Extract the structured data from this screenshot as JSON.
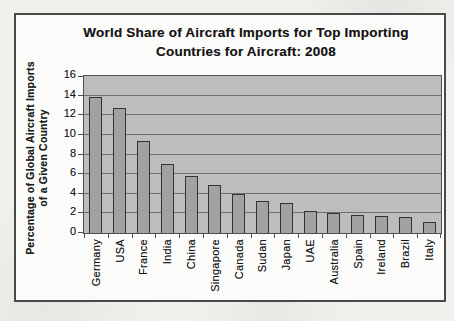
{
  "figure": {
    "title_line1": "World Share of Aircraft Imports for Top Importing",
    "title_line2": "Countries for Aircraft: 2008"
  },
  "chart_data": {
    "type": "bar",
    "title": "World Share of Aircraft Imports for Top Importing Countries for Aircraft: 2008",
    "ylabel": "Percentage of Global Aircraft Imports of a Given Country",
    "ylabel_line1": "Percentage of Global Aircraft Imports",
    "ylabel_line2": "of a Given Country",
    "xlabel": "",
    "categories": [
      "Germany",
      "USA",
      "France",
      "India",
      "China",
      "Singapore",
      "Canada",
      "Sudan",
      "Japan",
      "UAE",
      "Australia",
      "Spain",
      "Ireland",
      "Brazil",
      "Italy"
    ],
    "values": [
      13.9,
      12.7,
      9.4,
      7.0,
      5.8,
      4.9,
      4.0,
      3.3,
      3.1,
      2.2,
      2.0,
      1.8,
      1.7,
      1.6,
      1.1
    ],
    "ylim": [
      0,
      16
    ],
    "yticks": [
      0,
      2,
      4,
      6,
      8,
      10,
      12,
      14,
      16
    ],
    "grid": "horizontal",
    "legend": "none",
    "colors": {
      "bar_fill": "#a2a2a2",
      "bar_border": "#333333",
      "plot_bg": "#bdbdbd",
      "gridline": "#6e6e6e",
      "axis": "#4f4f4f",
      "figure_border": "#4a4a4a",
      "figure_bg": "#fbfbf9",
      "page_bg": "#f1f0ed",
      "text": "#1c1c1c"
    }
  }
}
